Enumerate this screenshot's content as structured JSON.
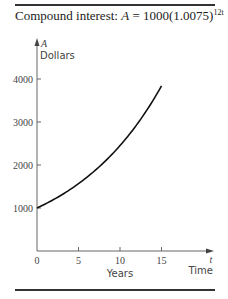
{
  "title": {
    "prefix": "Compound interest: ",
    "var": "A",
    "equation": " = 1000(1.0075)",
    "exponent": "12t"
  },
  "axes": {
    "y_var": "A",
    "y_label": "Dollars",
    "x_var": "t",
    "x_label": "Years",
    "x_end_label": "Time"
  },
  "chart_data": {
    "type": "line",
    "xlabel": "Years",
    "ylabel": "Dollars",
    "x_ticks": [
      "0",
      "5",
      "10",
      "15"
    ],
    "y_ticks": [
      "1000",
      "2000",
      "3000",
      "4000"
    ],
    "xlim": [
      0,
      21
    ],
    "ylim": [
      0,
      4700
    ],
    "grid": false,
    "series": [
      {
        "name": "A",
        "x": [
          0,
          2.5,
          5,
          7.5,
          10,
          12.5,
          15
        ],
        "values": [
          1000,
          1252,
          1567,
          1962,
          2454,
          3072,
          3838
        ]
      }
    ]
  }
}
